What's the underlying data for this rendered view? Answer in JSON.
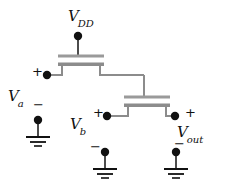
{
  "figure": {
    "kind": "circuit-schematic",
    "title_visible": false,
    "width": 227,
    "height": 185,
    "background_color": "#ffffff",
    "wire_color": "#4d4d4d",
    "device_bar_color": "#8c8c8c",
    "node_dot_color": "#111111",
    "text_color": "#111111"
  },
  "labels": {
    "vdd": {
      "base": "V",
      "sub": "DD"
    },
    "va": {
      "base": "V",
      "sub": "a"
    },
    "vb": {
      "base": "V",
      "sub": "b"
    },
    "vout": {
      "base": "V",
      "sub": "out"
    }
  },
  "polarity": {
    "va_plus": "+",
    "va_minus": "−",
    "vb_plus": "+",
    "vb_minus": "−",
    "vout_plus": "+",
    "vout_minus": "−"
  },
  "nodes": [
    {
      "name": "vdd-terminal",
      "x": 78,
      "y": 36
    },
    {
      "name": "va-plus-terminal",
      "x": 47,
      "y": 75
    },
    {
      "name": "va-minus-terminal",
      "x": 38,
      "y": 120
    },
    {
      "name": "vb-plus-terminal",
      "x": 107,
      "y": 116
    },
    {
      "name": "vb-minus-terminal",
      "x": 105,
      "y": 152
    },
    {
      "name": "vout-plus-terminal",
      "x": 175,
      "y": 116
    },
    {
      "name": "vout-minus-terminal",
      "x": 176,
      "y": 152
    }
  ],
  "transistors": [
    {
      "name": "top-nmos",
      "gate_bar_y": 56,
      "channel_bar_y": 64,
      "bar_left": 58,
      "bar_right": 104
    },
    {
      "name": "bottom-nmos",
      "gate_bar_y": 97,
      "channel_bar_y": 105,
      "bar_left": 124,
      "bar_right": 170
    }
  ],
  "grounds": [
    {
      "name": "ground-va",
      "x": 38,
      "top_y": 128
    },
    {
      "name": "ground-vb",
      "x": 105,
      "top_y": 160
    },
    {
      "name": "ground-vout",
      "x": 176,
      "top_y": 160
    }
  ]
}
